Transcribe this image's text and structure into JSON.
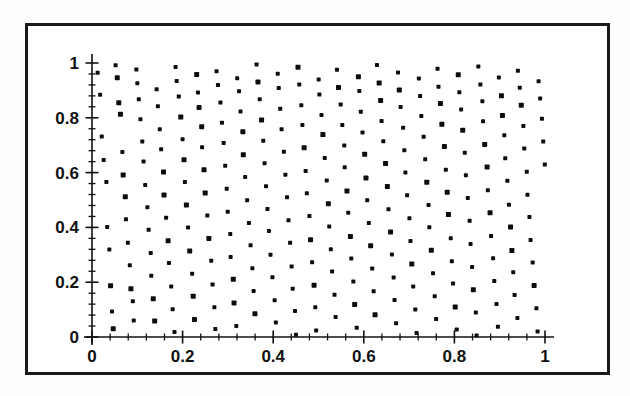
{
  "figure": {
    "background_color": "#ffffff",
    "frame_color": "#1a1a1a",
    "point_color": "#0d0d0d"
  },
  "chart_data": {
    "type": "scatter",
    "title": "",
    "subtitle": "",
    "xlabel": "",
    "ylabel": "",
    "xlim": [
      0,
      1
    ],
    "ylim": [
      0,
      1
    ],
    "grid": false,
    "legend": null,
    "annotations": [],
    "marker": "square",
    "marker_size_px": 4,
    "point_count": 800,
    "xticks": [
      0,
      0.2,
      0.4,
      0.6,
      0.8,
      1
    ],
    "yticks": [
      0,
      0.2,
      0.4,
      0.6,
      0.8,
      1
    ],
    "xtick_labels": [
      "0",
      "0.2",
      "0.4",
      "0.6",
      "0.8",
      "1"
    ],
    "ytick_labels": [
      "0",
      "0.2",
      "0.4",
      "0.6",
      "0.8",
      "1"
    ],
    "minor_ticks_per_interval": 4,
    "points": [
      [
        0.012,
        0.965
      ],
      [
        0.018,
        0.884
      ],
      [
        0.022,
        0.731
      ],
      [
        0.026,
        0.648
      ],
      [
        0.031,
        0.565
      ],
      [
        0.034,
        0.402
      ],
      [
        0.038,
        0.318
      ],
      [
        0.041,
        0.186
      ],
      [
        0.044,
        0.094
      ],
      [
        0.047,
        0.028
      ],
      [
        0.053,
        0.991
      ],
      [
        0.056,
        0.947
      ],
      [
        0.059,
        0.856
      ],
      [
        0.063,
        0.812
      ],
      [
        0.066,
        0.677
      ],
      [
        0.069,
        0.593
      ],
      [
        0.073,
        0.511
      ],
      [
        0.076,
        0.428
      ],
      [
        0.079,
        0.344
      ],
      [
        0.083,
        0.261
      ],
      [
        0.086,
        0.177
      ],
      [
        0.089,
        0.132
      ],
      [
        0.093,
        0.061
      ],
      [
        0.097,
        0.978
      ],
      [
        0.101,
        0.925
      ],
      [
        0.104,
        0.869
      ],
      [
        0.108,
        0.794
      ],
      [
        0.111,
        0.712
      ],
      [
        0.115,
        0.639
      ],
      [
        0.118,
        0.556
      ],
      [
        0.122,
        0.473
      ],
      [
        0.125,
        0.391
      ],
      [
        0.129,
        0.307
      ],
      [
        0.132,
        0.224
      ],
      [
        0.136,
        0.141
      ],
      [
        0.139,
        0.057
      ],
      [
        0.143,
        0.902
      ],
      [
        0.146,
        0.841
      ],
      [
        0.15,
        0.758
      ],
      [
        0.153,
        0.684
      ],
      [
        0.157,
        0.601
      ],
      [
        0.16,
        0.519
      ],
      [
        0.164,
        0.436
      ],
      [
        0.167,
        0.352
      ],
      [
        0.171,
        0.269
      ],
      [
        0.174,
        0.186
      ],
      [
        0.178,
        0.102
      ],
      [
        0.181,
        0.019
      ],
      [
        0.185,
        0.987
      ],
      [
        0.188,
        0.933
      ],
      [
        0.192,
        0.877
      ],
      [
        0.195,
        0.803
      ],
      [
        0.199,
        0.721
      ],
      [
        0.202,
        0.647
      ],
      [
        0.206,
        0.564
      ],
      [
        0.209,
        0.481
      ],
      [
        0.213,
        0.398
      ],
      [
        0.216,
        0.314
      ],
      [
        0.22,
        0.231
      ],
      [
        0.223,
        0.148
      ],
      [
        0.227,
        0.064
      ],
      [
        0.23,
        0.956
      ],
      [
        0.234,
        0.891
      ],
      [
        0.237,
        0.836
      ],
      [
        0.241,
        0.766
      ],
      [
        0.244,
        0.693
      ],
      [
        0.248,
        0.61
      ],
      [
        0.251,
        0.527
      ],
      [
        0.255,
        0.443
      ],
      [
        0.258,
        0.36
      ],
      [
        0.262,
        0.277
      ],
      [
        0.265,
        0.193
      ],
      [
        0.269,
        0.11
      ],
      [
        0.272,
        0.027
      ],
      [
        0.276,
        0.971
      ],
      [
        0.279,
        0.918
      ],
      [
        0.283,
        0.854
      ],
      [
        0.286,
        0.781
      ],
      [
        0.29,
        0.708
      ],
      [
        0.293,
        0.625
      ],
      [
        0.297,
        0.542
      ],
      [
        0.3,
        0.459
      ],
      [
        0.304,
        0.375
      ],
      [
        0.307,
        0.292
      ],
      [
        0.311,
        0.209
      ],
      [
        0.314,
        0.125
      ],
      [
        0.318,
        0.042
      ],
      [
        0.321,
        0.944
      ],
      [
        0.325,
        0.898
      ],
      [
        0.328,
        0.823
      ],
      [
        0.332,
        0.749
      ],
      [
        0.335,
        0.666
      ],
      [
        0.339,
        0.583
      ],
      [
        0.342,
        0.5
      ],
      [
        0.346,
        0.417
      ],
      [
        0.349,
        0.333
      ],
      [
        0.353,
        0.25
      ],
      [
        0.356,
        0.167
      ],
      [
        0.36,
        0.083
      ],
      [
        0.363,
        0.996
      ],
      [
        0.367,
        0.929
      ],
      [
        0.37,
        0.866
      ],
      [
        0.374,
        0.792
      ],
      [
        0.377,
        0.718
      ],
      [
        0.381,
        0.635
      ],
      [
        0.384,
        0.552
      ],
      [
        0.388,
        0.469
      ],
      [
        0.391,
        0.385
      ],
      [
        0.395,
        0.302
      ],
      [
        0.398,
        0.219
      ],
      [
        0.402,
        0.136
      ],
      [
        0.405,
        0.052
      ],
      [
        0.409,
        0.962
      ],
      [
        0.412,
        0.907
      ],
      [
        0.416,
        0.832
      ],
      [
        0.419,
        0.759
      ],
      [
        0.423,
        0.676
      ],
      [
        0.426,
        0.593
      ],
      [
        0.43,
        0.509
      ],
      [
        0.433,
        0.426
      ],
      [
        0.437,
        0.343
      ],
      [
        0.44,
        0.259
      ],
      [
        0.444,
        0.176
      ],
      [
        0.447,
        0.093
      ],
      [
        0.451,
        0.009
      ],
      [
        0.454,
        0.984
      ],
      [
        0.458,
        0.921
      ],
      [
        0.461,
        0.847
      ],
      [
        0.465,
        0.773
      ],
      [
        0.468,
        0.69
      ],
      [
        0.472,
        0.607
      ],
      [
        0.475,
        0.524
      ],
      [
        0.479,
        0.441
      ],
      [
        0.482,
        0.357
      ],
      [
        0.486,
        0.274
      ],
      [
        0.489,
        0.191
      ],
      [
        0.493,
        0.107
      ],
      [
        0.496,
        0.024
      ],
      [
        0.5,
        0.939
      ],
      [
        0.503,
        0.885
      ],
      [
        0.507,
        0.811
      ],
      [
        0.51,
        0.737
      ],
      [
        0.514,
        0.654
      ],
      [
        0.517,
        0.571
      ],
      [
        0.521,
        0.488
      ],
      [
        0.524,
        0.404
      ],
      [
        0.528,
        0.321
      ],
      [
        0.531,
        0.238
      ],
      [
        0.535,
        0.155
      ],
      [
        0.538,
        0.071
      ],
      [
        0.542,
        0.975
      ],
      [
        0.545,
        0.911
      ],
      [
        0.549,
        0.848
      ],
      [
        0.552,
        0.774
      ],
      [
        0.556,
        0.701
      ],
      [
        0.559,
        0.618
      ],
      [
        0.563,
        0.535
      ],
      [
        0.566,
        0.452
      ],
      [
        0.57,
        0.368
      ],
      [
        0.573,
        0.285
      ],
      [
        0.577,
        0.202
      ],
      [
        0.58,
        0.118
      ],
      [
        0.584,
        0.035
      ],
      [
        0.587,
        0.951
      ],
      [
        0.591,
        0.896
      ],
      [
        0.594,
        0.822
      ],
      [
        0.598,
        0.748
      ],
      [
        0.601,
        0.665
      ],
      [
        0.605,
        0.582
      ],
      [
        0.608,
        0.499
      ],
      [
        0.612,
        0.415
      ],
      [
        0.615,
        0.332
      ],
      [
        0.619,
        0.249
      ],
      [
        0.622,
        0.165
      ],
      [
        0.626,
        0.082
      ],
      [
        0.63,
        0.993
      ],
      [
        0.633,
        0.927
      ],
      [
        0.637,
        0.863
      ],
      [
        0.64,
        0.789
      ],
      [
        0.644,
        0.716
      ],
      [
        0.647,
        0.633
      ],
      [
        0.651,
        0.549
      ],
      [
        0.654,
        0.466
      ],
      [
        0.658,
        0.383
      ],
      [
        0.661,
        0.299
      ],
      [
        0.665,
        0.216
      ],
      [
        0.668,
        0.133
      ],
      [
        0.672,
        0.049
      ],
      [
        0.675,
        0.967
      ],
      [
        0.679,
        0.903
      ],
      [
        0.682,
        0.839
      ],
      [
        0.686,
        0.765
      ],
      [
        0.689,
        0.682
      ],
      [
        0.693,
        0.599
      ],
      [
        0.696,
        0.516
      ],
      [
        0.7,
        0.433
      ],
      [
        0.703,
        0.349
      ],
      [
        0.707,
        0.266
      ],
      [
        0.71,
        0.183
      ],
      [
        0.714,
        0.099
      ],
      [
        0.717,
        0.016
      ],
      [
        0.721,
        0.942
      ],
      [
        0.724,
        0.879
      ],
      [
        0.728,
        0.805
      ],
      [
        0.731,
        0.731
      ],
      [
        0.735,
        0.648
      ],
      [
        0.738,
        0.565
      ],
      [
        0.742,
        0.482
      ],
      [
        0.745,
        0.399
      ],
      [
        0.749,
        0.315
      ],
      [
        0.752,
        0.232
      ],
      [
        0.756,
        0.149
      ],
      [
        0.759,
        0.065
      ],
      [
        0.763,
        0.98
      ],
      [
        0.766,
        0.915
      ],
      [
        0.77,
        0.851
      ],
      [
        0.773,
        0.777
      ],
      [
        0.777,
        0.694
      ],
      [
        0.78,
        0.611
      ],
      [
        0.784,
        0.528
      ],
      [
        0.787,
        0.445
      ],
      [
        0.791,
        0.361
      ],
      [
        0.794,
        0.278
      ],
      [
        0.798,
        0.195
      ],
      [
        0.801,
        0.111
      ],
      [
        0.805,
        0.028
      ],
      [
        0.808,
        0.958
      ],
      [
        0.812,
        0.893
      ],
      [
        0.815,
        0.829
      ],
      [
        0.819,
        0.756
      ],
      [
        0.822,
        0.672
      ],
      [
        0.826,
        0.589
      ],
      [
        0.829,
        0.506
      ],
      [
        0.833,
        0.423
      ],
      [
        0.836,
        0.339
      ],
      [
        0.84,
        0.256
      ],
      [
        0.843,
        0.173
      ],
      [
        0.847,
        0.089
      ],
      [
        0.85,
        0.006
      ],
      [
        0.854,
        0.989
      ],
      [
        0.857,
        0.923
      ],
      [
        0.861,
        0.859
      ],
      [
        0.864,
        0.786
      ],
      [
        0.868,
        0.702
      ],
      [
        0.871,
        0.619
      ],
      [
        0.875,
        0.536
      ],
      [
        0.878,
        0.453
      ],
      [
        0.882,
        0.369
      ],
      [
        0.885,
        0.286
      ],
      [
        0.889,
        0.203
      ],
      [
        0.892,
        0.119
      ],
      [
        0.896,
        0.036
      ],
      [
        0.899,
        0.946
      ],
      [
        0.903,
        0.882
      ],
      [
        0.906,
        0.808
      ],
      [
        0.91,
        0.735
      ],
      [
        0.913,
        0.652
      ],
      [
        0.917,
        0.568
      ],
      [
        0.92,
        0.485
      ],
      [
        0.924,
        0.402
      ],
      [
        0.927,
        0.318
      ],
      [
        0.931,
        0.235
      ],
      [
        0.934,
        0.152
      ],
      [
        0.938,
        0.068
      ],
      [
        0.941,
        0.972
      ],
      [
        0.945,
        0.908
      ],
      [
        0.948,
        0.844
      ],
      [
        0.952,
        0.771
      ],
      [
        0.955,
        0.687
      ],
      [
        0.959,
        0.604
      ],
      [
        0.962,
        0.521
      ],
      [
        0.966,
        0.438
      ],
      [
        0.969,
        0.354
      ],
      [
        0.973,
        0.271
      ],
      [
        0.976,
        0.188
      ],
      [
        0.98,
        0.104
      ],
      [
        0.983,
        0.021
      ],
      [
        0.987,
        0.935
      ],
      [
        0.99,
        0.871
      ],
      [
        0.994,
        0.797
      ],
      [
        0.997,
        0.714
      ],
      [
        0.999,
        0.631
      ]
    ]
  }
}
